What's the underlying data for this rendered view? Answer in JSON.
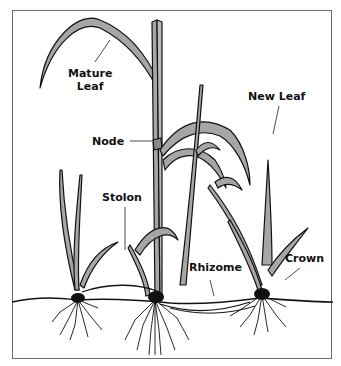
{
  "diagram": {
    "labels": {
      "mature_leaf_line1": "Mature",
      "mature_leaf_line2": "Leaf",
      "node": "Node",
      "new_leaf": "New Leaf",
      "stolon": "Stolon",
      "rhizome": "Rhizome",
      "crown": "Crown"
    },
    "colors": {
      "leaf_fill": "#a6a6a6",
      "outline": "#111111",
      "frame": "#6a6a6a",
      "background": "#ffffff"
    }
  }
}
